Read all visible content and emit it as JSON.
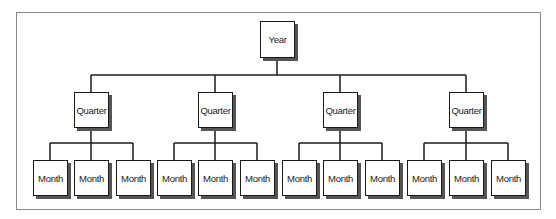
{
  "diagram": {
    "type": "hierarchy",
    "root": {
      "label": "Year",
      "children": [
        {
          "label": "Quarter",
          "children": [
            {
              "label": "Month"
            },
            {
              "label": "Month"
            },
            {
              "label": "Month"
            }
          ]
        },
        {
          "label": "Quarter",
          "children": [
            {
              "label": "Month"
            },
            {
              "label": "Month"
            },
            {
              "label": "Month"
            }
          ]
        },
        {
          "label": "Quarter",
          "children": [
            {
              "label": "Month"
            },
            {
              "label": "Month"
            },
            {
              "label": "Month"
            }
          ]
        },
        {
          "label": "Quarter",
          "children": [
            {
              "label": "Month"
            },
            {
              "label": "Month"
            },
            {
              "label": "Month"
            }
          ]
        }
      ]
    }
  }
}
